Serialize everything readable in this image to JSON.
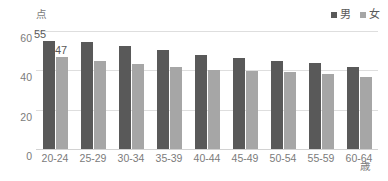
{
  "chart_data": {
    "type": "bar",
    "title": "",
    "xlabel": "歳",
    "ylabel": "点",
    "categories": [
      "20-24",
      "25-29",
      "30-34",
      "35-39",
      "40-44",
      "45-49",
      "50-54",
      "55-59",
      "60-64"
    ],
    "series": [
      {
        "name": "男",
        "color": "#595959",
        "values": [
          55,
          54.5,
          52.5,
          50.5,
          48,
          46.5,
          45,
          43.5,
          41.5
        ]
      },
      {
        "name": "女",
        "color": "#a6a6a6",
        "values": [
          47,
          44.5,
          43,
          41.5,
          40,
          39.8,
          39,
          38,
          36.5
        ]
      }
    ],
    "ylim": [
      0,
      60
    ],
    "yticks": [
      "60",
      "40",
      "20",
      "0"
    ],
    "ytick_values": [
      60,
      40,
      20,
      0
    ],
    "grid": true,
    "legend_position": "top-right",
    "data_labels": [
      {
        "series": "男",
        "category": "20-24",
        "text": "55"
      },
      {
        "series": "女",
        "category": "20-24",
        "text": "47"
      }
    ]
  },
  "legend": {
    "items": [
      {
        "label": "男",
        "color": "#595959"
      },
      {
        "label": "女",
        "color": "#a6a6a6"
      }
    ]
  },
  "axis": {
    "y_unit": "点",
    "x_unit": "歳"
  },
  "colors": {
    "male": "#595959",
    "female": "#a6a6a6",
    "grid": "#dedede",
    "text": "#7b7b7b",
    "background": "#ffffff"
  }
}
